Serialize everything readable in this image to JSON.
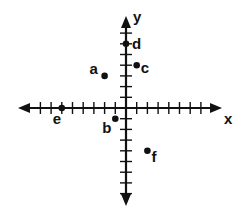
{
  "diagram": {
    "type": "coordinate-plane",
    "axes": {
      "x_label": "x",
      "y_label": "y",
      "x_range": [
        -8,
        7
      ],
      "y_range": [
        -8,
        8
      ]
    },
    "points": [
      {
        "label": "a",
        "x": -2,
        "y": 3
      },
      {
        "label": "b",
        "x": -1,
        "y": -1
      },
      {
        "label": "c",
        "x": 1,
        "y": 4
      },
      {
        "label": "d",
        "x": 0,
        "y": 6
      },
      {
        "label": "e",
        "x": -6,
        "y": 0
      },
      {
        "label": "f",
        "x": 2,
        "y": -4
      }
    ],
    "colors": {
      "ink": "#111111",
      "background": "#ffffff"
    }
  }
}
